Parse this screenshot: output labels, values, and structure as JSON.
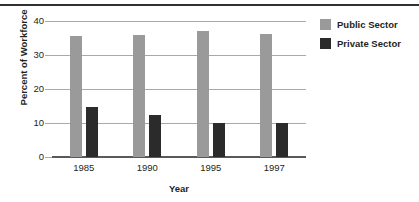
{
  "chart_data": {
    "type": "bar",
    "title": "",
    "subtitle": "",
    "xlabel": "Year",
    "ylabel": "Percent of Workforce",
    "categories": [
      "1985",
      "1990",
      "1995",
      "1997"
    ],
    "series": [
      {
        "name": "Public Sector",
        "color": "#9a9a9a",
        "values": [
          35.6,
          36.0,
          37.0,
          36.2
        ]
      },
      {
        "name": "Private Sector",
        "color": "#2b2b2b",
        "values": [
          14.7,
          12.3,
          10.0,
          10.0
        ]
      }
    ],
    "ylim": [
      0,
      40
    ],
    "yticks": [
      0,
      10,
      20,
      30,
      40
    ],
    "ytick_labels": [
      "0",
      "10",
      "20",
      "30",
      "40"
    ],
    "grid": "horizontal",
    "legend_position": "right",
    "background": "#ffffff",
    "gridline_color": "#a9a9a9",
    "axis_color": "#58595b",
    "rule_color": "#2f3133"
  }
}
